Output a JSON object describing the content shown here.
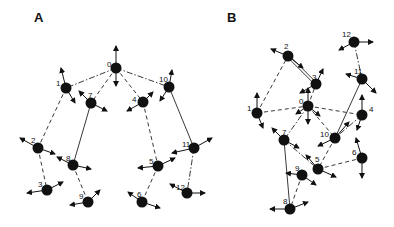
{
  "figure": {
    "panels": [
      {
        "id": "A",
        "label": "A",
        "label_pos": [
          34,
          22
        ],
        "nodes": [
          {
            "id": "0",
            "x": 116,
            "y": 68,
            "lx": 107,
            "ly": 64,
            "arrows": [
              [
                0,
                -22
              ],
              [
                0,
                18
              ]
            ]
          },
          {
            "id": "1",
            "x": 66,
            "y": 88,
            "lx": 56,
            "ly": 83,
            "arrows": [
              [
                -5,
                -20
              ],
              [
                9,
                15
              ]
            ]
          },
          {
            "id": "7",
            "x": 91,
            "y": 103,
            "lx": 88,
            "ly": 95,
            "arrows": [
              [
                -12,
                -12
              ],
              [
                16,
                8
              ]
            ]
          },
          {
            "id": "4",
            "x": 143,
            "y": 102,
            "lx": 132,
            "ly": 99,
            "arrows": [
              [
                10,
                -10
              ],
              [
                -16,
                9
              ]
            ]
          },
          {
            "id": "10",
            "x": 169,
            "y": 87,
            "lx": 159,
            "ly": 79,
            "arrows": [
              [
                3,
                -17
              ],
              [
                -9,
                14
              ]
            ]
          },
          {
            "id": "2",
            "x": 38,
            "y": 148,
            "lx": 31,
            "ly": 140,
            "arrows": [
              [
                -18,
                -10
              ],
              [
                17,
                6
              ]
            ]
          },
          {
            "id": "8",
            "x": 73,
            "y": 165,
            "lx": 66,
            "ly": 158,
            "arrows": [
              [
                -16,
                -8
              ],
              [
                18,
                4
              ]
            ]
          },
          {
            "id": "3",
            "x": 47,
            "y": 190,
            "lx": 38,
            "ly": 184,
            "arrows": [
              [
                -20,
                3
              ],
              [
                16,
                -8
              ]
            ]
          },
          {
            "id": "9",
            "x": 88,
            "y": 202,
            "lx": 79,
            "ly": 196,
            "arrows": [
              [
                -18,
                3
              ],
              [
                12,
                -12
              ]
            ]
          },
          {
            "id": "5",
            "x": 158,
            "y": 166,
            "lx": 149,
            "ly": 161,
            "arrows": [
              [
                -20,
                2
              ],
              [
                17,
                -8
              ]
            ]
          },
          {
            "id": "11",
            "x": 194,
            "y": 148,
            "lx": 182,
            "ly": 144,
            "arrows": [
              [
                -22,
                5
              ],
              [
                18,
                -10
              ]
            ]
          },
          {
            "id": "6",
            "x": 142,
            "y": 202,
            "lx": 137,
            "ly": 194,
            "arrows": [
              [
                -14,
                -10
              ],
              [
                18,
                6
              ]
            ]
          },
          {
            "id": "12",
            "x": 187,
            "y": 193,
            "lx": 176,
            "ly": 187,
            "arrows": [
              [
                -17,
                -9
              ],
              [
                18,
                0
              ]
            ]
          }
        ],
        "edges": [
          {
            "from": "0",
            "to": "1",
            "style": "dashdot"
          },
          {
            "from": "0",
            "to": "7",
            "style": "dashed"
          },
          {
            "from": "0",
            "to": "4",
            "style": "dashed"
          },
          {
            "from": "0",
            "to": "10",
            "style": "dashdot"
          },
          {
            "from": "1",
            "to": "2",
            "style": "dashed"
          },
          {
            "from": "7",
            "to": "8",
            "style": "solid"
          },
          {
            "from": "4",
            "to": "5",
            "style": "dashed"
          },
          {
            "from": "10",
            "to": "11",
            "style": "solid"
          },
          {
            "from": "2",
            "to": "3",
            "style": "dashed"
          },
          {
            "from": "8",
            "to": "9",
            "style": "dashed"
          },
          {
            "from": "5",
            "to": "6",
            "style": "dashed"
          },
          {
            "from": "11",
            "to": "12",
            "style": "dashdot"
          }
        ]
      },
      {
        "id": "B",
        "label": "B",
        "label_pos": [
          227,
          22
        ],
        "nodes": [
          {
            "id": "2",
            "x": 288,
            "y": 56,
            "lx": 284,
            "ly": 46,
            "arrows": [
              [
                -17,
                -7
              ],
              [
                15,
                12
              ]
            ]
          },
          {
            "id": "3",
            "x": 316,
            "y": 84,
            "lx": 312,
            "ly": 77,
            "arrows": [
              [
                7,
                -15
              ],
              [
                -16,
                9
              ]
            ]
          },
          {
            "id": "12",
            "x": 354,
            "y": 42,
            "lx": 342,
            "ly": 34,
            "arrows": [
              [
                -15,
                8
              ],
              [
                19,
                0
              ]
            ]
          },
          {
            "id": "11",
            "x": 362,
            "y": 79,
            "lx": 354,
            "ly": 71,
            "arrows": [
              [
                -16,
                -5
              ],
              [
                14,
                14
              ]
            ]
          },
          {
            "id": "1",
            "x": 257,
            "y": 113,
            "lx": 247,
            "ly": 108,
            "arrows": [
              [
                0,
                -20
              ],
              [
                6,
                15
              ]
            ]
          },
          {
            "id": "0",
            "x": 308,
            "y": 106,
            "lx": 299,
            "ly": 101,
            "arrows": [
              [
                0,
                -18
              ],
              [
                0,
                18
              ],
              [
                -12,
                8
              ],
              [
                12,
                10
              ]
            ]
          },
          {
            "id": "4",
            "x": 362,
            "y": 115,
            "lx": 369,
            "ly": 109,
            "arrows": [
              [
                0,
                -20
              ],
              [
                -5,
                15
              ]
            ]
          },
          {
            "id": "7",
            "x": 284,
            "y": 140,
            "lx": 282,
            "ly": 132,
            "arrows": [
              [
                -12,
                -12
              ],
              [
                15,
                8
              ]
            ]
          },
          {
            "id": "10",
            "x": 335,
            "y": 138,
            "lx": 320,
            "ly": 134,
            "arrows": [
              [
                14,
                -16
              ],
              [
                -17,
                8
              ]
            ]
          },
          {
            "id": "6",
            "x": 362,
            "y": 158,
            "lx": 352,
            "ly": 152,
            "arrows": [
              [
                -6,
                -20
              ],
              [
                0,
                20
              ]
            ]
          },
          {
            "id": "5",
            "x": 318,
            "y": 169,
            "lx": 315,
            "ly": 159,
            "arrows": [
              [
                -12,
                -14
              ],
              [
                18,
                8
              ]
            ]
          },
          {
            "id": "9",
            "x": 302,
            "y": 175,
            "lx": 295,
            "ly": 168,
            "arrows": [
              [
                -16,
                -2
              ],
              [
                14,
                10
              ]
            ]
          },
          {
            "id": "8",
            "x": 290,
            "y": 209,
            "lx": 283,
            "ly": 201,
            "arrows": [
              [
                -20,
                0
              ],
              [
                18,
                -7
              ]
            ]
          }
        ],
        "edges": [
          {
            "from": "1",
            "to": "2",
            "style": "dashed"
          },
          {
            "from": "2",
            "to": "3",
            "style": "double"
          },
          {
            "from": "1",
            "to": "0",
            "style": "dashed"
          },
          {
            "from": "0",
            "to": "3",
            "style": "dashed"
          },
          {
            "from": "0",
            "to": "7",
            "style": "dashdot"
          },
          {
            "from": "0",
            "to": "10",
            "style": "dashed"
          },
          {
            "from": "0",
            "to": "4",
            "style": "dashed"
          },
          {
            "from": "12",
            "to": "11",
            "style": "dashdot"
          },
          {
            "from": "11",
            "to": "10",
            "style": "solid"
          },
          {
            "from": "4",
            "to": "10",
            "style": "dashdot"
          },
          {
            "from": "10",
            "to": "5",
            "style": "dashed"
          },
          {
            "from": "7",
            "to": "5",
            "style": "dashdot"
          },
          {
            "from": "5",
            "to": "6",
            "style": "dashed"
          },
          {
            "from": "7",
            "to": "8",
            "style": "solid"
          },
          {
            "from": "9",
            "to": "8",
            "style": "dashed"
          }
        ]
      }
    ],
    "colors": {
      "node": "#111111",
      "edge": "#222222",
      "background": "#ffffff"
    }
  }
}
